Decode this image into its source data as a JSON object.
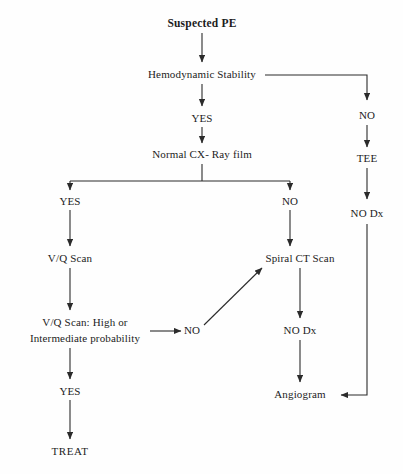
{
  "diagram": {
    "kind": "clinical-decision-flowchart",
    "title": "Suspected PE",
    "background_color": "#fefefe",
    "line_color": "#2b2b2b",
    "text_color": "#1c1c1c",
    "nodes": [
      {
        "id": "suspected_pe",
        "label": "Suspected PE",
        "x": 202,
        "y": 23,
        "style": "title"
      },
      {
        "id": "hemodynamic",
        "label": "Hemodynamic Stability",
        "x": 202,
        "y": 75,
        "style": "node"
      },
      {
        "id": "yes_hemo",
        "label": "YES",
        "x": 202,
        "y": 119,
        "style": "branch"
      },
      {
        "id": "normal_cxr",
        "label": "Normal CX- Ray film",
        "x": 202,
        "y": 155,
        "style": "node"
      },
      {
        "id": "yes_cxr",
        "label": "YES",
        "x": 70,
        "y": 202,
        "style": "branch"
      },
      {
        "id": "no_cxr",
        "label": "NO",
        "x": 290,
        "y": 202,
        "style": "branch"
      },
      {
        "id": "vq_scan",
        "label": "V/Q Scan",
        "x": 70,
        "y": 259,
        "style": "node"
      },
      {
        "id": "spiral_ct",
        "label": "Spiral CT Scan",
        "x": 300,
        "y": 259,
        "style": "node"
      },
      {
        "id": "vq_prob_line1",
        "label": "V/Q Scan: High or",
        "x": 85,
        "y": 323,
        "style": "node"
      },
      {
        "id": "vq_prob_line2",
        "label": "Intermediate probability",
        "x": 85,
        "y": 339,
        "style": "node"
      },
      {
        "id": "no_vq",
        "label": "NO",
        "x": 192,
        "y": 331,
        "style": "branch"
      },
      {
        "id": "no_dx_ct",
        "label": "NO Dx",
        "x": 300,
        "y": 331,
        "style": "branch"
      },
      {
        "id": "yes_vq",
        "label": "YES",
        "x": 70,
        "y": 392,
        "style": "branch"
      },
      {
        "id": "angiogram",
        "label": "Angiogram",
        "x": 300,
        "y": 395,
        "style": "node"
      },
      {
        "id": "treat",
        "label": "TREAT",
        "x": 70,
        "y": 452,
        "style": "terminal"
      },
      {
        "id": "no_hemo",
        "label": "NO",
        "x": 367,
        "y": 116,
        "style": "branch"
      },
      {
        "id": "tee",
        "label": "TEE",
        "x": 367,
        "y": 159,
        "style": "node"
      },
      {
        "id": "no_dx_tee",
        "label": "NO Dx",
        "x": 367,
        "y": 214,
        "style": "branch"
      }
    ],
    "edges": [
      {
        "id": "e-pe-hemo",
        "from": "suspected_pe",
        "to": "hemodynamic",
        "type": "arrow-down"
      },
      {
        "id": "e-hemo-yes",
        "from": "hemodynamic",
        "to": "yes_hemo",
        "type": "arrow-down"
      },
      {
        "id": "e-yes-cxr",
        "from": "yes_hemo",
        "to": "normal_cxr",
        "type": "arrow-down"
      },
      {
        "id": "e-hemo-no",
        "from": "hemodynamic",
        "to": "no_hemo",
        "type": "elbow-right-down"
      },
      {
        "id": "e-no-tee",
        "from": "no_hemo",
        "to": "tee",
        "type": "arrow-down"
      },
      {
        "id": "e-tee-nodx",
        "from": "tee",
        "to": "no_dx_tee",
        "type": "arrow-down"
      },
      {
        "id": "e-nodx-angio",
        "from": "no_dx_tee",
        "to": "angiogram",
        "type": "elbow-down-left"
      },
      {
        "id": "e-cxr-split",
        "from": "normal_cxr",
        "to": "yes_cxr,no_cxr",
        "type": "split-down"
      },
      {
        "id": "e-yescxr-vq",
        "from": "yes_cxr",
        "to": "vq_scan",
        "type": "arrow-down"
      },
      {
        "id": "e-nocxr-ct",
        "from": "no_cxr",
        "to": "spiral_ct",
        "type": "arrow-down"
      },
      {
        "id": "e-vq-prob",
        "from": "vq_scan",
        "to": "vq_prob_line1",
        "type": "arrow-down"
      },
      {
        "id": "e-prob-no",
        "from": "vq_prob_line2",
        "to": "no_vq",
        "type": "arrow-right"
      },
      {
        "id": "e-no-ct",
        "from": "no_vq",
        "to": "spiral_ct",
        "type": "arrow-diagonal"
      },
      {
        "id": "e-prob-yes",
        "from": "vq_prob_line2",
        "to": "yes_vq",
        "type": "arrow-down"
      },
      {
        "id": "e-yes-treat",
        "from": "yes_vq",
        "to": "treat",
        "type": "arrow-down"
      },
      {
        "id": "e-ct-nodx",
        "from": "spiral_ct",
        "to": "no_dx_ct",
        "type": "arrow-down"
      },
      {
        "id": "e-nodx-angio2",
        "from": "no_dx_ct",
        "to": "angiogram",
        "type": "arrow-down"
      }
    ]
  }
}
